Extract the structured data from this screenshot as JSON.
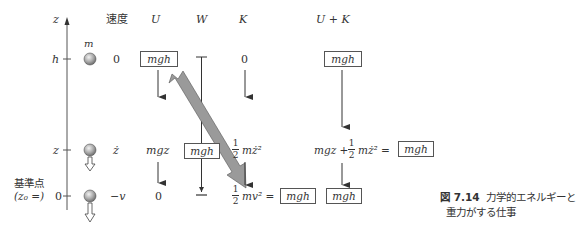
{
  "axis": {
    "label": "z",
    "tick_h": "h",
    "tick_z": "z",
    "tick_0": "0",
    "reference_label_line1": "基準点",
    "reference_label_line2": "(z₀ =)"
  },
  "header": {
    "velocity": "速度",
    "U": "U",
    "W": "W",
    "K": "K",
    "UK": "U + K"
  },
  "mass_label": "m",
  "rows": {
    "top": {
      "velocity": "0",
      "U": "mgh",
      "K": "0",
      "UK": "mgh"
    },
    "middle": {
      "velocity": "ż",
      "U": "mgz",
      "W": "mgh",
      "K_num": "1",
      "K_den": "2",
      "K_rest": "mż²",
      "UK_prefix": "mgz +",
      "UK_num": "1",
      "UK_den": "2",
      "UK_rest": "mż² =",
      "UK_box": "mgh"
    },
    "bottom": {
      "velocity": "−v",
      "U": "0",
      "K_num": "1",
      "K_den": "2",
      "K_rest": "mv² =",
      "K_box": "mgh",
      "UK": "mgh"
    }
  },
  "caption": {
    "number": "図 7.14",
    "line1": "力学的エネルギーと",
    "line2": "重力がする仕事"
  },
  "colors": {
    "ball": "#a8a8a8",
    "big_arrow": "#9a9a9a",
    "line": "#333333"
  }
}
